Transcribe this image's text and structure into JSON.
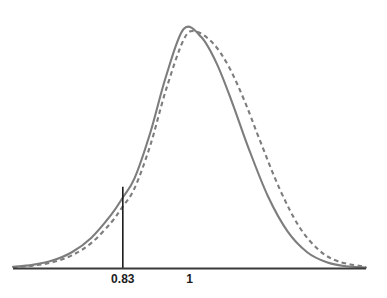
{
  "chart_data": {
    "type": "line",
    "title": "",
    "subtitle": "",
    "xlabel": "",
    "ylabel": "",
    "grid": false,
    "legend": "none",
    "axis": {
      "x_axis_shown": true,
      "y_axis_shown": false,
      "x_tick_labels": [
        "0.83",
        "1"
      ],
      "x_tick_values": [
        0.83,
        1
      ],
      "xlim": [
        0.55,
        1.45
      ],
      "ylim": [
        0,
        1.05
      ]
    },
    "annotations": [
      {
        "name": "vertical-reference-line",
        "x": 0.83,
        "y_top": 0.34,
        "y_bottom": 0,
        "label": "0.83",
        "color": "#1c1c1c"
      }
    ],
    "series": [
      {
        "name": "solid-normal-curve",
        "style": "solid",
        "color": "#7d7d7d",
        "mean": 0.985,
        "peak_value": 1.0,
        "x": [
          0.55,
          0.6,
          0.65,
          0.7,
          0.75,
          0.8,
          0.83,
          0.86,
          0.9,
          0.94,
          0.985,
          1.03,
          1.07,
          1.11,
          1.15,
          1.2,
          1.25,
          1.3,
          1.35,
          1.4,
          1.45
        ],
        "y": [
          0.005,
          0.013,
          0.031,
          0.066,
          0.127,
          0.222,
          0.295,
          0.376,
          0.566,
          0.801,
          1.0,
          0.966,
          0.853,
          0.687,
          0.504,
          0.3,
          0.153,
          0.066,
          0.024,
          0.007,
          0.002
        ]
      },
      {
        "name": "dashed-normal-curve",
        "style": "dashed",
        "color": "#7d7d7d",
        "mean": 1.015,
        "peak_value": 0.99,
        "x": [
          0.55,
          0.6,
          0.65,
          0.7,
          0.75,
          0.8,
          0.83,
          0.86,
          0.9,
          0.94,
          0.985,
          1.015,
          1.06,
          1.1,
          1.14,
          1.18,
          1.23,
          1.28,
          1.33,
          1.38,
          1.45
        ],
        "y": [
          0.004,
          0.01,
          0.024,
          0.053,
          0.105,
          0.19,
          0.258,
          0.334,
          0.513,
          0.745,
          0.955,
          0.99,
          0.94,
          0.843,
          0.7,
          0.532,
          0.33,
          0.172,
          0.075,
          0.027,
          0.005
        ]
      }
    ],
    "colors": {
      "curve": "#7d7d7d",
      "axis": "#3a3a3a",
      "annotation_line": "#1c1c1c",
      "label_text": "#1c1c1c",
      "background": "#ffffff"
    }
  },
  "labels": {
    "tick_083": "0.83",
    "tick_1": "1"
  }
}
